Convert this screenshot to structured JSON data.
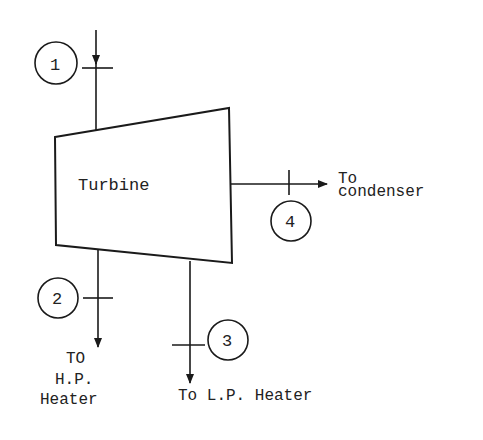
{
  "diagram": {
    "component": {
      "label": "Turbine"
    },
    "states": [
      {
        "id": "1",
        "label": "1"
      },
      {
        "id": "2",
        "label": "2"
      },
      {
        "id": "3",
        "label": "3"
      },
      {
        "id": "4",
        "label": "4"
      }
    ],
    "destinations": {
      "condenser": {
        "line1": "To",
        "line2": "condenser"
      },
      "hp_heater": {
        "line1": "TO",
        "line2": "H.P.",
        "line3": "Heater"
      },
      "lp_heater": {
        "label": "To L.P. Heater"
      }
    }
  }
}
